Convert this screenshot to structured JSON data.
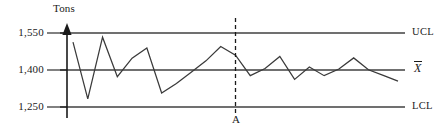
{
  "chart_data": {
    "type": "line",
    "title": "",
    "subtitle": "",
    "xlabel": "",
    "ylabel": "Tons",
    "ylim": [
      1180,
      1600
    ],
    "grid": false,
    "legend_position": "right",
    "y_ticks": [
      {
        "value": 1550,
        "label": "1,550"
      },
      {
        "value": 1400,
        "label": "1,400"
      },
      {
        "value": 1250,
        "label": "1,250"
      }
    ],
    "control_lines": [
      {
        "name": "UCL",
        "label": "UCL",
        "value": 1550,
        "style": "solid",
        "color": "#707070"
      },
      {
        "name": "center",
        "label": "X̄",
        "value": 1400,
        "style": "solid",
        "color": "#707070"
      },
      {
        "name": "LCL",
        "label": "LCL",
        "value": 1250,
        "style": "solid",
        "color": "#707070"
      }
    ],
    "annotations": [
      {
        "name": "A",
        "label": "A",
        "type": "vertical-marker",
        "x_index": 11,
        "style": "dashed",
        "color": "#1a1a1a"
      }
    ],
    "series": [
      {
        "name": "sample-means",
        "color": "#3a3a3a",
        "x": [
          0,
          1,
          2,
          3,
          4,
          5,
          6,
          7,
          8,
          9,
          10,
          11,
          12,
          13,
          14,
          15,
          16,
          17,
          18,
          19,
          20,
          21,
          22
        ],
        "values": [
          1513,
          1283,
          1533,
          1373,
          1448,
          1489,
          1307,
          1345,
          1391,
          1437,
          1495,
          1460,
          1377,
          1406,
          1455,
          1362,
          1412,
          1377,
          1404,
          1449,
          1401,
          1378,
          1355
        ]
      }
    ]
  },
  "axis": {
    "y_title": "Tons",
    "arrow_name": "y-axis-arrow"
  }
}
